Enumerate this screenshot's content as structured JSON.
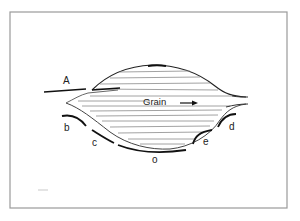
{
  "diagram": {
    "labels": {
      "A": "A",
      "b": "b",
      "c": "c",
      "o": "o",
      "e": "e",
      "d": "d",
      "grain": "Grain"
    },
    "colors": {
      "ink": "#111111",
      "hatch": "#8a8a8a",
      "border": "#9a9a9a",
      "background": "#ffffff"
    }
  }
}
